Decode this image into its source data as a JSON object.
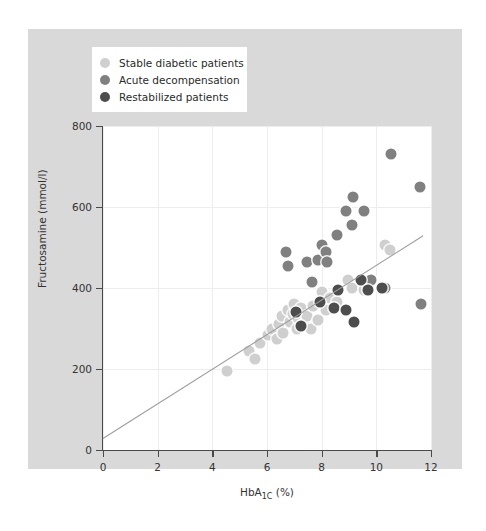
{
  "chart_data": {
    "type": "scatter",
    "title": "",
    "xlabel": "HbA1C (%)",
    "xlabel_base": "HbA",
    "xlabel_sub": "1C",
    "xlabel_unit": " (%)",
    "ylabel": "Fructosamine (mmol/l)",
    "xlim": [
      0,
      12
    ],
    "ylim": [
      0,
      800
    ],
    "xticks": [
      0,
      2,
      4,
      6,
      8,
      10,
      12
    ],
    "yticks": [
      0,
      200,
      400,
      600,
      800
    ],
    "grid": true,
    "legend_position": "top-left",
    "colors": {
      "stable": "#cfcfcf",
      "acute": "#808080",
      "restabilized": "#4d4d4d",
      "regression_line": "#9c9c9c",
      "figure_background": "#d9d9d9",
      "plot_background": "#ffffff",
      "gridline": "#ededed",
      "axis": "#4a4a4a",
      "text": "#333333"
    },
    "regression_line": {
      "x0": 0.0,
      "y0": 30,
      "x1": 11.7,
      "y1": 530
    },
    "series": [
      {
        "name": "Stable diabetic patients",
        "color_key": "stable",
        "points": [
          [
            4.55,
            195
          ],
          [
            5.35,
            245
          ],
          [
            5.55,
            225
          ],
          [
            5.75,
            265
          ],
          [
            6.05,
            285
          ],
          [
            6.2,
            300
          ],
          [
            6.35,
            275
          ],
          [
            6.45,
            310
          ],
          [
            6.55,
            330
          ],
          [
            6.6,
            290
          ],
          [
            6.75,
            345
          ],
          [
            6.85,
            315
          ],
          [
            6.95,
            335
          ],
          [
            7.0,
            360
          ],
          [
            7.1,
            300
          ],
          [
            7.15,
            325
          ],
          [
            7.25,
            350
          ],
          [
            7.35,
            310
          ],
          [
            7.45,
            330
          ],
          [
            7.6,
            300
          ],
          [
            7.7,
            355
          ],
          [
            7.85,
            320
          ],
          [
            8.0,
            390
          ],
          [
            8.15,
            345
          ],
          [
            8.3,
            375
          ],
          [
            8.55,
            365
          ],
          [
            8.95,
            420
          ],
          [
            9.1,
            400
          ],
          [
            9.55,
            395
          ],
          [
            10.3,
            505
          ],
          [
            10.5,
            495
          ]
        ]
      },
      {
        "name": "Acute decompensation",
        "color_key": "acute",
        "points": [
          [
            6.7,
            490
          ],
          [
            6.75,
            455
          ],
          [
            7.45,
            465
          ],
          [
            7.85,
            470
          ],
          [
            8.0,
            505
          ],
          [
            8.15,
            490
          ],
          [
            8.2,
            465
          ],
          [
            7.65,
            415
          ],
          [
            8.55,
            530
          ],
          [
            8.9,
            590
          ],
          [
            9.15,
            625
          ],
          [
            9.55,
            590
          ],
          [
            9.1,
            555
          ],
          [
            10.55,
            730
          ],
          [
            11.6,
            650
          ],
          [
            9.7,
            405
          ],
          [
            9.8,
            420
          ],
          [
            10.3,
            400
          ],
          [
            11.65,
            360
          ]
        ]
      },
      {
        "name": "Restabilized patients",
        "color_key": "restabilized",
        "points": [
          [
            7.05,
            340
          ],
          [
            7.25,
            305
          ],
          [
            7.95,
            365
          ],
          [
            8.45,
            350
          ],
          [
            8.6,
            395
          ],
          [
            8.9,
            345
          ],
          [
            9.2,
            315
          ],
          [
            9.45,
            420
          ],
          [
            9.7,
            395
          ],
          [
            10.2,
            400
          ]
        ]
      }
    ]
  },
  "legend": {
    "items": [
      {
        "label": "Stable diabetic patients",
        "color": "#cfcfcf"
      },
      {
        "label": "Acute decompensation",
        "color": "#808080"
      },
      {
        "label": "Restabilized patients",
        "color": "#4d4d4d"
      }
    ]
  },
  "axes": {
    "x_tick_labels": [
      "0",
      "2",
      "4",
      "6",
      "8",
      "10",
      "12"
    ],
    "y_tick_labels": [
      "0",
      "200",
      "400",
      "600",
      "800"
    ],
    "x_title_base": "HbA",
    "x_title_sub": "1C",
    "x_title_unit": " (%)",
    "y_title": "Fructosamine (mmol/l)"
  }
}
